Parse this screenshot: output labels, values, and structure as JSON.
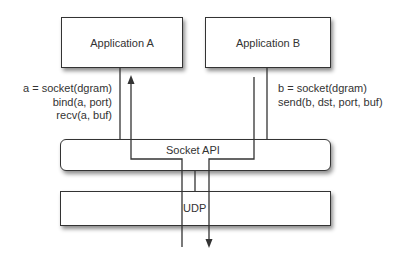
{
  "diagram": {
    "nodes": {
      "app_a": {
        "label": "Application A"
      },
      "app_b": {
        "label": "Application B"
      },
      "socket_api": {
        "label": "Socket API"
      },
      "udp": {
        "label": "UDP"
      }
    },
    "annotations": {
      "app_a_calls": [
        "a = socket(dgram)",
        "bind(a, port)",
        "recv(a, buf)"
      ],
      "app_b_calls": [
        "b = socket(dgram)",
        "send(b, dst, port, buf)"
      ]
    },
    "flows": [
      {
        "from": "udp",
        "to": "app_a",
        "direction": "up",
        "via": "socket_api"
      },
      {
        "from": "app_b",
        "to": "udp",
        "direction": "down",
        "via": "socket_api"
      }
    ],
    "colors": {
      "stroke": "#333333",
      "fill": "#ffffff",
      "text": "#333333"
    }
  }
}
